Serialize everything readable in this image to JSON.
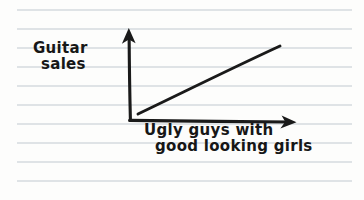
{
  "page": {
    "width": 364,
    "height": 200,
    "paper_color": "#fdfdfc",
    "rule_color": "#dfe3e6",
    "ink_color": "#1a1a1a",
    "media": "handwritten sketch on ruled notebook paper"
  },
  "paper": {
    "rule_line_count": 10,
    "rule_first_y": 10,
    "rule_spacing": 19,
    "rule_left_x": 17,
    "rule_right_x": 352
  },
  "chart_data": {
    "type": "line",
    "title": "",
    "subtitle": "",
    "xlabel": "Ugly guys with good looking girls",
    "ylabel": "Guitar sales",
    "xlabel_lines": [
      "Ugly guys with",
      "good looking girls"
    ],
    "ylabel_lines": [
      "Guitar",
      "sales"
    ],
    "x": [
      0,
      1
    ],
    "values": [
      0.12,
      0.85
    ],
    "series": [
      {
        "name": "Guitar sales trend",
        "x": [
          0,
          1
        ],
        "values": [
          0.12,
          0.85
        ]
      }
    ],
    "xlim": [
      0,
      1
    ],
    "ylim": [
      0,
      1
    ],
    "grid": false,
    "legend": false,
    "tick_labels_x": [],
    "tick_labels_y": [],
    "annotations": [],
    "axes_style": "hand-drawn arrows, no tick marks, no scale",
    "trend": "positive linear correlation"
  },
  "geometry": {
    "origin_x": 130,
    "origin_y": 120,
    "y_axis_top_y": 28,
    "x_axis_right_x": 295,
    "x_axis_right_y": 122,
    "trend_start_x": 138,
    "trend_start_y": 114,
    "trend_end_x": 280,
    "trend_end_y": 46
  },
  "labels": {
    "y_axis_label": "Guitar sales",
    "x_axis_label": "Ugly guys with good looking girls"
  },
  "icons": {
    "y_axis_arrow": "arrow-up-icon",
    "x_axis_arrow": "arrow-right-icon"
  }
}
